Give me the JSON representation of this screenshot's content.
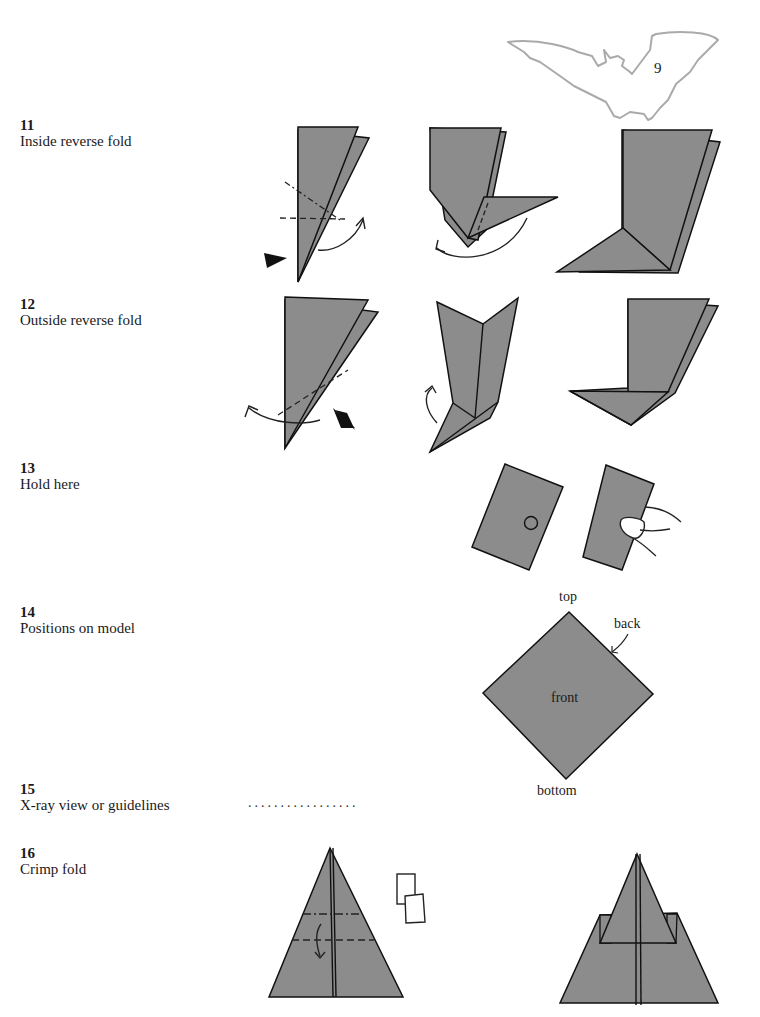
{
  "page": {
    "number": "9",
    "header_icon": "bat-silhouette-icon"
  },
  "legend": [
    {
      "num": "11",
      "label": "Inside reverse fold"
    },
    {
      "num": "12",
      "label": "Outside reverse fold"
    },
    {
      "num": "13",
      "label": "Hold here"
    },
    {
      "num": "14",
      "label": "Positions on model"
    },
    {
      "num": "15",
      "label": "X-ray view or guidelines"
    },
    {
      "num": "16",
      "label": "Crimp fold"
    }
  ],
  "model_positions": {
    "top": "top",
    "back": "back",
    "front": "front",
    "bottom": "bottom"
  },
  "xray_symbol": ".................",
  "colors": {
    "paper_gray": "#8c8c8c",
    "line": "#111111",
    "bat_outline": "#aaaaaa"
  }
}
